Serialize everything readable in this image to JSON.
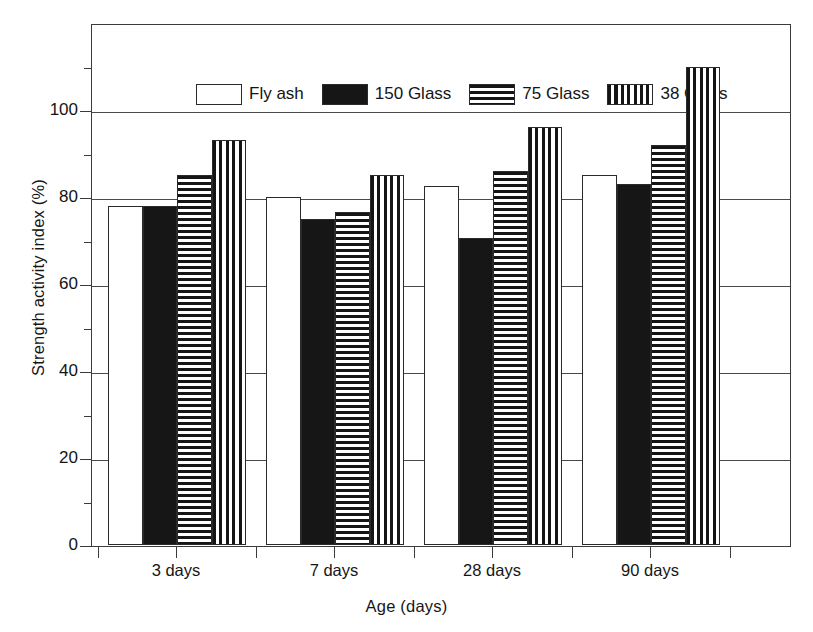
{
  "chart_data": {
    "type": "bar",
    "title": "",
    "subtitle": "",
    "xlabel": "Age (days)",
    "ylabel": "Strength activity index (%)",
    "categories": [
      "3 days",
      "7 days",
      "28 days",
      "90 days"
    ],
    "series": [
      {
        "name": "Fly ash",
        "fill": "white",
        "values": [
          78,
          80,
          82.5,
          85
        ]
      },
      {
        "name": "150 Glass",
        "fill": "solid",
        "values": [
          78,
          75,
          70.5,
          83
        ]
      },
      {
        "name": "75 Glass",
        "fill": "hstripe",
        "values": [
          85,
          76.5,
          86,
          92
        ]
      },
      {
        "name": "38 Glass",
        "fill": "vstripe",
        "values": [
          93,
          85,
          96,
          110
        ]
      }
    ],
    "ylim": [
      0,
      120
    ],
    "yticks_major": [
      0,
      20,
      40,
      60,
      80,
      100
    ],
    "yticks_minor": [
      10,
      30,
      50,
      70,
      90,
      110
    ],
    "ytick_labels": [
      "0",
      "20",
      "40",
      "60",
      "80",
      "100"
    ],
    "gridlines": [
      20,
      40,
      60,
      80,
      100
    ],
    "grid": true,
    "legend_position": "top-left-inside",
    "axis_color": "#3b3b3b",
    "bar_edge_color": "#2a2a2a",
    "background": "#ffffff"
  },
  "legend": {
    "entries": [
      {
        "label": "Fly ash",
        "swatch": "white-rect-icon"
      },
      {
        "label": "150 Glass",
        "swatch": "solid-black-rect-icon"
      },
      {
        "label": "75 Glass",
        "swatch": "horizontal-stripe-rect-icon"
      },
      {
        "label": "38 Glass",
        "swatch": "vertical-stripe-rect-icon"
      }
    ]
  }
}
